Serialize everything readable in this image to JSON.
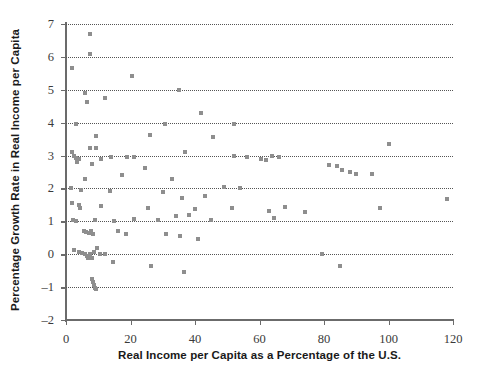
{
  "chart_data": {
    "type": "scatter",
    "title": "",
    "xlabel": "Real Income per Capita as a Percentage of the U.S.",
    "ylabel": "Percentage Growth Rate in Real Income per Capita",
    "xlim": [
      0,
      120
    ],
    "ylim": [
      -2,
      7
    ],
    "xticks": [
      0,
      20,
      40,
      60,
      80,
      100,
      120
    ],
    "yticks": [
      -2,
      -1,
      0,
      1,
      2,
      3,
      4,
      5,
      6,
      7
    ],
    "xtick_labels": [
      "0",
      "20",
      "40",
      "60",
      "80",
      "100",
      "120"
    ],
    "ytick_labels": [
      "-2",
      "-1",
      "0",
      "1",
      "2",
      "3",
      "4",
      "5",
      "6",
      "7"
    ],
    "grid": "horizontal-dotted",
    "legend": "none",
    "marker": "square",
    "marker_color": "#8e8e8e",
    "marker_size_px": 4,
    "points": [
      [
        7.4,
        6.7
      ],
      [
        7.4,
        6.1
      ],
      [
        1.8,
        5.65
      ],
      [
        20.6,
        5.42
      ],
      [
        5.9,
        4.89
      ],
      [
        35.0,
        5.0
      ],
      [
        6.5,
        4.63
      ],
      [
        12.0,
        4.74
      ],
      [
        42.0,
        4.28
      ],
      [
        3.0,
        3.95
      ],
      [
        30.6,
        3.95
      ],
      [
        52.0,
        3.97
      ],
      [
        9.2,
        3.6
      ],
      [
        26.0,
        3.63
      ],
      [
        45.5,
        3.55
      ],
      [
        2.0,
        3.1
      ],
      [
        7.3,
        3.22
      ],
      [
        9.3,
        3.22
      ],
      [
        36.8,
        3.1
      ],
      [
        64.0,
        3.0
      ],
      [
        2.6,
        2.98
      ],
      [
        3.1,
        2.93
      ],
      [
        4.0,
        2.9
      ],
      [
        10.9,
        2.9
      ],
      [
        14.0,
        2.95
      ],
      [
        19.0,
        2.97
      ],
      [
        21.0,
        2.97
      ],
      [
        52.0,
        2.98
      ],
      [
        56.0,
        2.95
      ],
      [
        60.5,
        2.9
      ],
      [
        62.0,
        2.86
      ],
      [
        66.0,
        2.95
      ],
      [
        3.3,
        2.8
      ],
      [
        8.2,
        2.75
      ],
      [
        24.5,
        2.62
      ],
      [
        17.5,
        2.4
      ],
      [
        81.5,
        2.72
      ],
      [
        84.0,
        2.69
      ],
      [
        85.5,
        2.55
      ],
      [
        88.0,
        2.5
      ],
      [
        90.0,
        2.45
      ],
      [
        95.0,
        2.45
      ],
      [
        100.0,
        3.35
      ],
      [
        6.0,
        2.28
      ],
      [
        33.0,
        2.3
      ],
      [
        49.0,
        2.05
      ],
      [
        54.0,
        2.0
      ],
      [
        1.5,
        2.0
      ],
      [
        4.5,
        1.95
      ],
      [
        13.5,
        1.93
      ],
      [
        30.0,
        1.9
      ],
      [
        36.0,
        1.72
      ],
      [
        43.0,
        1.78
      ],
      [
        2.0,
        1.55
      ],
      [
        4.0,
        1.5
      ],
      [
        4.4,
        1.42
      ],
      [
        11.0,
        1.48
      ],
      [
        25.5,
        1.4
      ],
      [
        40.0,
        1.37
      ],
      [
        51.5,
        1.42
      ],
      [
        63.0,
        1.32
      ],
      [
        68.0,
        1.45
      ],
      [
        64.5,
        1.1
      ],
      [
        74.0,
        1.28
      ],
      [
        97.5,
        1.4
      ],
      [
        118.0,
        1.68
      ],
      [
        2.3,
        1.05
      ],
      [
        3.0,
        1.0
      ],
      [
        9.0,
        1.05
      ],
      [
        15.0,
        1.0
      ],
      [
        21.0,
        1.07
      ],
      [
        28.5,
        1.05
      ],
      [
        34.0,
        1.15
      ],
      [
        38.0,
        1.2
      ],
      [
        45.0,
        1.05
      ],
      [
        5.5,
        0.72
      ],
      [
        6.2,
        0.68
      ],
      [
        7.0,
        0.66
      ],
      [
        7.8,
        0.72
      ],
      [
        8.4,
        0.62
      ],
      [
        16.0,
        0.7
      ],
      [
        18.5,
        0.62
      ],
      [
        31.0,
        0.62
      ],
      [
        35.5,
        0.55
      ],
      [
        41.0,
        0.45
      ],
      [
        2.6,
        0.12
      ],
      [
        4.0,
        0.06
      ],
      [
        5.0,
        0.05
      ],
      [
        5.8,
        0.0
      ],
      [
        6.4,
        -0.05
      ],
      [
        6.9,
        -0.1
      ],
      [
        7.5,
        0.0
      ],
      [
        8.0,
        -0.12
      ],
      [
        8.6,
        0.08
      ],
      [
        9.6,
        0.18
      ],
      [
        10.4,
        0.02
      ],
      [
        12.0,
        0.02
      ],
      [
        79.5,
        0.02
      ],
      [
        14.5,
        -0.25
      ],
      [
        26.5,
        -0.35
      ],
      [
        36.5,
        -0.55
      ],
      [
        85.0,
        -0.35
      ],
      [
        8.0,
        -0.75
      ],
      [
        8.3,
        -0.85
      ],
      [
        8.6,
        -0.95
      ],
      [
        8.9,
        -1.02
      ],
      [
        9.4,
        -1.05
      ]
    ]
  }
}
